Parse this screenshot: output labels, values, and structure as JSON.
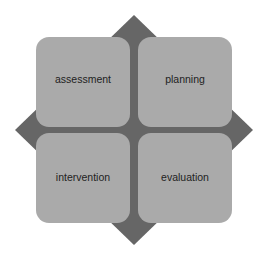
{
  "diagram": {
    "type": "quadrant-cycle",
    "colors": {
      "diamond": "#666666",
      "box": "#aaaaaa",
      "text": "#222222",
      "background": "#ffffff"
    },
    "quadrants": [
      {
        "position": "top-left",
        "label": "assessment"
      },
      {
        "position": "top-right",
        "label": "planning"
      },
      {
        "position": "bottom-left",
        "label": "intervention"
      },
      {
        "position": "bottom-right",
        "label": "evaluation"
      }
    ]
  }
}
